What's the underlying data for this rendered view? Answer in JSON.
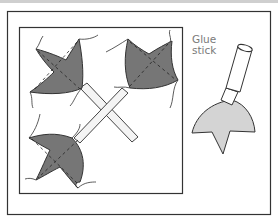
{
  "figure": {
    "label": {
      "line1": "Glue",
      "line2": "stick"
    },
    "colors": {
      "petal_fill": "#767676",
      "glue_fill": "#d4d4d4",
      "stroke": "#333333",
      "label_text": "#7a7a7a"
    },
    "parts": [
      "outer-frame",
      "inner-square",
      "three-leaf-shapes",
      "crossed-sticks",
      "glue-stick"
    ]
  }
}
